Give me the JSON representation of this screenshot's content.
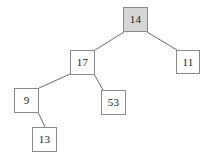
{
  "diagram": {
    "type": "binary-tree",
    "canvas": {
      "width": 216,
      "height": 159,
      "background": "#ffffff"
    },
    "style": {
      "node_border_color": "#8a8a8a",
      "node_fill_default": "#ffffff",
      "node_fill_highlight": "#d6d6d6",
      "edge_color": "#6e6e6e",
      "text_color": "#1a1a1a"
    },
    "nodes": [
      {
        "id": "n14",
        "label": "14",
        "x": 123,
        "y": 7,
        "w": 25,
        "h": 25,
        "fill": "highlight",
        "role": "root"
      },
      {
        "id": "n17",
        "label": "17",
        "x": 70,
        "y": 50,
        "w": 25,
        "h": 25,
        "fill": "default",
        "role": "left-child-of-14"
      },
      {
        "id": "n11",
        "label": "11",
        "x": 176,
        "y": 50,
        "w": 24,
        "h": 24,
        "fill": "default",
        "role": "right-child-of-14"
      },
      {
        "id": "n9",
        "label": "9",
        "x": 14,
        "y": 88,
        "w": 25,
        "h": 25,
        "fill": "default",
        "role": "left-child-of-17"
      },
      {
        "id": "n53",
        "label": "53",
        "x": 101,
        "y": 90,
        "w": 25,
        "h": 25,
        "fill": "default",
        "role": "right-child-of-17"
      },
      {
        "id": "n13",
        "label": "13",
        "x": 32,
        "y": 127,
        "w": 25,
        "h": 25,
        "fill": "default",
        "role": "right-child-of-9"
      }
    ],
    "edges": [
      {
        "id": "e14-17",
        "from": "n14",
        "to": "n17",
        "x1": 124,
        "y1": 32,
        "x2": 95,
        "y2": 50
      },
      {
        "id": "e14-11",
        "from": "n14",
        "to": "n11",
        "x1": 147,
        "y1": 32,
        "x2": 177,
        "y2": 50
      },
      {
        "id": "e17-9",
        "from": "n17",
        "to": "n9",
        "x1": 70,
        "y1": 74,
        "x2": 39,
        "y2": 88
      },
      {
        "id": "e17-53",
        "from": "n17",
        "to": "n53",
        "x1": 94,
        "y1": 74,
        "x2": 103,
        "y2": 90
      },
      {
        "id": "e9-13",
        "from": "n9",
        "to": "n13",
        "x1": 38,
        "y1": 112,
        "x2": 45,
        "y2": 127
      }
    ]
  }
}
